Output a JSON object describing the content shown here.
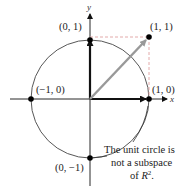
{
  "figure": {
    "axes": {
      "x_label": "x",
      "y_label": "y"
    },
    "points": [
      {
        "label": "(0, 1)",
        "coords": [
          0,
          1
        ]
      },
      {
        "label": "(1, 1)",
        "coords": [
          1,
          1
        ]
      },
      {
        "label": "(−1, 0)",
        "coords": [
          -1,
          0
        ]
      },
      {
        "label": "(1, 0)",
        "coords": [
          1,
          0
        ]
      },
      {
        "label": "(0, −1)",
        "coords": [
          0,
          -1
        ]
      }
    ],
    "annotation": {
      "line1": "The unit circle is",
      "line2": "not a subspace",
      "line3_prefix": "of ",
      "line3_var": "R",
      "line3_sup": "2",
      "line3_suffix": "."
    },
    "colors": {
      "axes": "#111111",
      "circle": "#444444",
      "vector_sum": "#999999",
      "dashed_guides": "#e0a0a0",
      "points": "#000000"
    }
  }
}
